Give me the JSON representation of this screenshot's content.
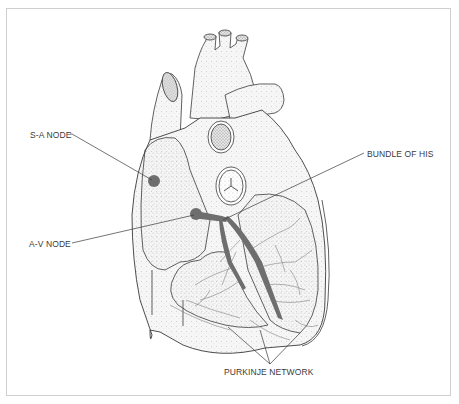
{
  "diagram": {
    "labels": {
      "sa_node": "S-A NODE",
      "av_node": "A-V NODE",
      "bundle_of_his": "BUNDLE OF HIS",
      "purkinje_network": "PURKINJE NETWORK"
    },
    "colors": {
      "background": "#ffffff",
      "frame": "#cfcfcf",
      "outline": "#3a3a3a",
      "conduction_tissue": "#6e6e6e",
      "stipple": "#9a9a9a",
      "label_text": "#3a3a3a"
    }
  }
}
